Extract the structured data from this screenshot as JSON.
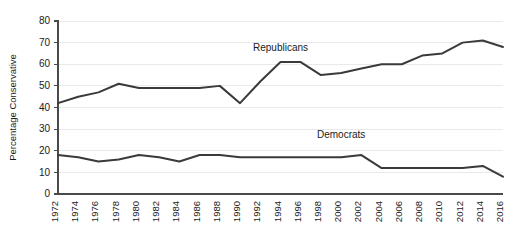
{
  "chart_data": {
    "type": "line",
    "title": "",
    "xlabel": "",
    "ylabel": "Percentage Conservative",
    "ylim": [
      0,
      80
    ],
    "yticks": [
      0,
      10,
      20,
      30,
      40,
      50,
      60,
      70,
      80
    ],
    "grid": true,
    "legend_position": "inline-annotation",
    "x": [
      1972,
      1974,
      1976,
      1978,
      1980,
      1982,
      1984,
      1986,
      1988,
      1990,
      1992,
      1994,
      1996,
      1998,
      2000,
      2002,
      2004,
      2006,
      2008,
      2010,
      2012,
      2014,
      2016
    ],
    "categories": [
      "1972",
      "1974",
      "1976",
      "1978",
      "1980",
      "1982",
      "1984",
      "1986",
      "1988",
      "1990",
      "1992",
      "1994",
      "1996",
      "1998",
      "2000",
      "2002",
      "2004",
      "2006",
      "2008",
      "2010",
      "2012",
      "2014",
      "2016"
    ],
    "series": [
      {
        "name": "Republicans",
        "values": [
          42,
          45,
          47,
          51,
          49,
          49,
          49,
          49,
          50,
          42,
          52,
          61,
          61,
          55,
          56,
          58,
          60,
          60,
          64,
          65,
          70,
          71,
          68
        ],
        "annotation": "Republicans",
        "annotation_x": 1994,
        "annotation_y": 66
      },
      {
        "name": "Democrats",
        "values": [
          18,
          17,
          15,
          16,
          18,
          17,
          15,
          18,
          18,
          17,
          17,
          17,
          17,
          17,
          17,
          18,
          12,
          12,
          12,
          12,
          12,
          13,
          8
        ],
        "annotation": "Democrats",
        "annotation_x": 2000,
        "annotation_y": 26
      }
    ]
  }
}
